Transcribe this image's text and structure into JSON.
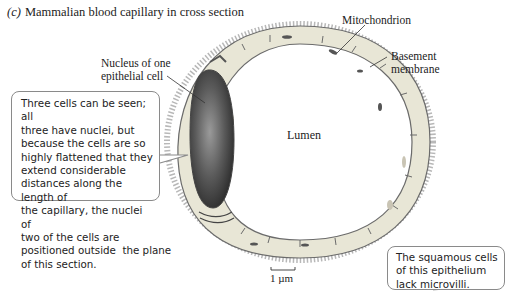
{
  "figure": {
    "panel_letter": "(c)",
    "title": "Mammalian blood capillary in cross section"
  },
  "labels": {
    "mitochondrion": "Mitochondrion",
    "basement_membrane_line1": "Basement",
    "basement_membrane_line2": "membrane",
    "nucleus_line1": "Nucleus of one",
    "nucleus_line2": "epithelial cell",
    "lumen": "Lumen",
    "scale_bar": "1 µm"
  },
  "callouts": {
    "left": {
      "lines": [
        "Three cells can be seen; all",
        "three have nuclei, but",
        "because the cells are so",
        "highly flattened that they",
        "extend considerable",
        "distances along the length of",
        "the capillary, the nuclei of",
        "two of the cells are",
        "positioned outside  the plane",
        "of this section."
      ]
    },
    "right": {
      "lines": [
        "The squamous cells",
        "of this epithelium",
        "lack microvilli."
      ]
    }
  },
  "colors": {
    "cell_fill": "#e8e6d6",
    "nucleus_dark": "#3a3a3a",
    "outline": "#6b6b6b",
    "basement_dots": "#9a9a9a",
    "callout_border": "#8a8a8a"
  }
}
